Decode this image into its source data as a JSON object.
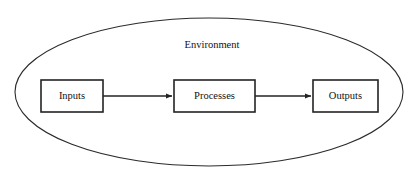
{
  "diagram": {
    "type": "systems-flow",
    "title": "",
    "background_color": "#ffffff",
    "line_color": "#232323",
    "text_color": "#111111",
    "container": {
      "shape": "ellipse",
      "label": "Environment",
      "cx": 209,
      "cy": 92,
      "rx": 194,
      "ry": 74,
      "label_x": 212,
      "label_y": 46
    },
    "nodes": [
      {
        "id": "inputs",
        "label": "Inputs",
        "x": 41,
        "y": 80,
        "width": 62,
        "height": 32
      },
      {
        "id": "processes",
        "label": "Processes",
        "x": 174,
        "y": 80,
        "width": 81,
        "height": 32
      },
      {
        "id": "outputs",
        "label": "Outputs",
        "x": 313,
        "y": 80,
        "width": 65,
        "height": 32
      }
    ],
    "connectors": [
      {
        "id": "inputs-to-processes",
        "from": "inputs",
        "to": "processes",
        "x1": 103,
        "x2": 172,
        "y": 96,
        "arrowhead": "solid-triangle"
      },
      {
        "id": "processes-to-outputs",
        "from": "processes",
        "to": "outputs",
        "x1": 255,
        "x2": 311,
        "y": 96,
        "arrowhead": "solid-triangle"
      }
    ]
  }
}
